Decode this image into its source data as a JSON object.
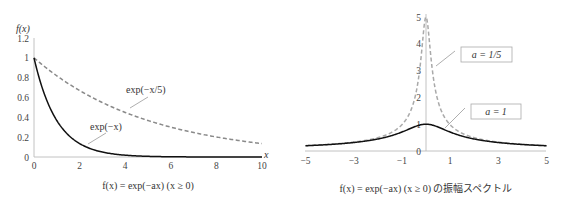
{
  "colors": {
    "solid": "#111111",
    "dashed": "#8a8a8a",
    "dashed_right": "#a9a9a9",
    "axis": "#bbbbbb",
    "text": "#333333"
  },
  "left_chart": {
    "y_axis_label": "f(x)",
    "x_axis_label": "x",
    "y_ticks": [
      "0",
      "0.2",
      "0.4",
      "0.6",
      "0.8",
      "1",
      "1.2"
    ],
    "x_ticks": [
      "0",
      "2",
      "4",
      "6",
      "8",
      "10"
    ],
    "annotation_slow": "exp(−x/5)",
    "annotation_fast": "exp(−x)",
    "caption": "f(x) = exp(−ax) (x ≥ 0)"
  },
  "right_chart": {
    "y_ticks": [
      "0",
      "1",
      "2",
      "3",
      "4",
      "5"
    ],
    "x_ticks": [
      "−5",
      "−3",
      "−1",
      "1",
      "3",
      "5"
    ],
    "legend_a_fifth": "a = 1/5",
    "legend_a_one": "a = 1",
    "caption": "f(x) = exp(−ax) (x ≥ 0) の振幅スペクトル"
  },
  "chart_data": [
    {
      "type": "line",
      "title": "f(x) = exp(−ax) (x ≥ 0)",
      "xlabel": "x",
      "ylabel": "f(x)",
      "xlim": [
        0,
        10
      ],
      "ylim": [
        0,
        1.2
      ],
      "xticks": [
        0,
        2,
        4,
        6,
        8,
        10
      ],
      "yticks": [
        0,
        0.2,
        0.4,
        0.6,
        0.8,
        1,
        1.2
      ],
      "grid": false,
      "series": [
        {
          "name": "exp(−x)",
          "style": "solid",
          "a": 1,
          "x": [
            0,
            1,
            2,
            3,
            4,
            5,
            6,
            7,
            8,
            9,
            10
          ],
          "y": [
            1.0,
            0.368,
            0.135,
            0.05,
            0.018,
            0.007,
            0.002,
            0.001,
            0.0,
            0.0,
            0.0
          ]
        },
        {
          "name": "exp(−x/5)",
          "style": "dashed",
          "a": 0.2,
          "x": [
            0,
            1,
            2,
            3,
            4,
            5,
            6,
            7,
            8,
            9,
            10
          ],
          "y": [
            1.0,
            0.819,
            0.67,
            0.549,
            0.449,
            0.368,
            0.301,
            0.247,
            0.202,
            0.165,
            0.135
          ]
        }
      ]
    },
    {
      "type": "line",
      "title": "f(x) = exp(−ax) (x ≥ 0) の振幅スペクトル",
      "xlabel": "",
      "ylabel": "",
      "xlim": [
        -5,
        5
      ],
      "ylim": [
        0,
        5
      ],
      "xticks": [
        -5,
        -3,
        -1,
        1,
        3,
        5
      ],
      "yticks": [
        0,
        1,
        2,
        3,
        4,
        5
      ],
      "grid": false,
      "formula": "1/sqrt(a^2 + w^2)",
      "series": [
        {
          "name": "a = 1",
          "style": "solid",
          "a": 1,
          "x": [
            -5,
            -3,
            -2,
            -1,
            -0.5,
            0,
            0.5,
            1,
            2,
            3,
            5
          ],
          "y": [
            0.196,
            0.316,
            0.447,
            0.707,
            0.894,
            1.0,
            0.894,
            0.707,
            0.447,
            0.316,
            0.196
          ]
        },
        {
          "name": "a = 1/5",
          "style": "dashed",
          "a": 0.2,
          "x": [
            -5,
            -3,
            -2,
            -1,
            -0.5,
            -0.2,
            0,
            0.2,
            0.5,
            1,
            2,
            3,
            5
          ],
          "y": [
            0.2,
            0.333,
            0.498,
            0.981,
            1.857,
            3.536,
            5.0,
            3.536,
            1.857,
            0.981,
            0.498,
            0.333,
            0.2
          ]
        }
      ]
    }
  ]
}
